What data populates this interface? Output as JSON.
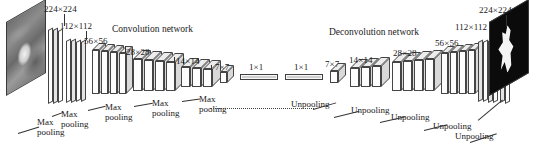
{
  "figure": {
    "type": "neural-network-architecture-diagram",
    "sections": {
      "left_title": "Convolution network",
      "right_title": "Deconvolution network"
    },
    "input": {
      "name": "input-image",
      "dimension": "224 × 224"
    },
    "output": {
      "name": "output-segmentation-map",
      "dimension": "224 × 224"
    },
    "encoder_dims": [
      "224×224",
      "112×112",
      "56×56",
      "28×28",
      "14×14",
      "7×7"
    ],
    "decoder_dims": [
      "7×7",
      "14×14",
      "28×28",
      "56×56",
      "112×112",
      "224×224"
    ],
    "bottleneck_dims": [
      "1×1",
      "1×1"
    ],
    "encoder_ops": [
      {
        "line1": "Max",
        "line2": "pooling"
      },
      {
        "line1": "Max",
        "line2": "pooling"
      },
      {
        "line1": "Max",
        "line2": "pooling"
      },
      {
        "line1": "Max",
        "line2": "pooling"
      },
      {
        "line1": "Max",
        "line2": "pooling"
      }
    ],
    "decoder_ops": [
      {
        "label": "Unpooling"
      },
      {
        "label": "Unpooling"
      },
      {
        "label": "Unpooling"
      },
      {
        "label": "Unpooling"
      },
      {
        "label": "Unpooling"
      }
    ],
    "colors": {
      "stroke": "#3a3a3a",
      "face": "#fdfdfd",
      "top": "#e9e9e9",
      "side": "#dcdcdc",
      "output_background": "#0b0b0b",
      "output_mask": "#f4f4f4",
      "text": "#1a1a1a"
    }
  }
}
